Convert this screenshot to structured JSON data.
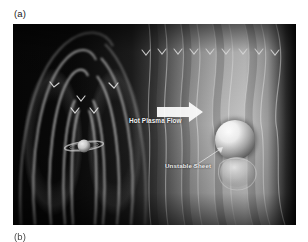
{
  "figure": {
    "panel_a_caption": "(a)",
    "panel_b_caption": "(b)",
    "background_color": "#ffffff"
  },
  "image_panel": {
    "alt_description": "Artist rendering of a planetary magnetosphere showing a ringed planet with nested dipole magnetic field loops on the left, a bright plasma region with wavy stretched field lines on the right, a bright spherical body, and a pinched unstable current sheet.",
    "border_color": "#050505"
  },
  "annotations": {
    "hot_plasma_flow": {
      "label": "Hot Plasma Flow",
      "arrow": "thick-right-arrow",
      "color": "#f2f2f2"
    },
    "unstable_sheet": {
      "label": "Unstable Sheet",
      "leader": "thin-line-pointer",
      "color": "#ededed"
    }
  },
  "scene": {
    "central_body": "ringed-planet",
    "secondary_body": "bright-sphere",
    "field_line_arrowheads": "chevron",
    "arrowhead_color": "#e8e8e8",
    "dark_color": "#050505",
    "light_color": "#cfcfcf"
  }
}
